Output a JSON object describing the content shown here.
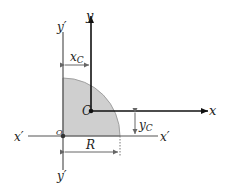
{
  "diagram": {
    "labels": {
      "y_axis": "y",
      "x_axis": "x",
      "y_prime_top": "y′",
      "y_prime_bottom": "y′",
      "x_prime_left": "x′",
      "x_prime_right": "x′",
      "centroid": "C",
      "origin": "O",
      "xc": "x",
      "xc_sub": "C",
      "yc": "y",
      "yc_sub": "C",
      "radius": "R"
    },
    "colors": {
      "fill": "#cfcfcf",
      "edge": "#9a9a9a",
      "axis": "#111111",
      "ref_axis": "#555555",
      "dim": "#666666"
    }
  }
}
